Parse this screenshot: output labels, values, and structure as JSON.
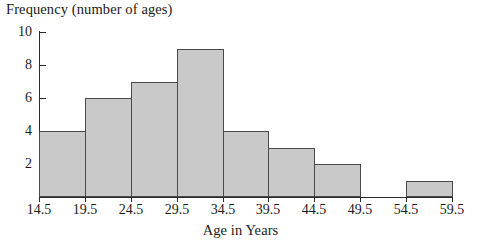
{
  "chart_data": {
    "type": "bar",
    "title": "Frequency (number of ages)",
    "xlabel": "Age in Years",
    "ylabel": "Frequency (number of ages)",
    "grid": false,
    "legend": "none",
    "bin_edges": [
      14.5,
      19.5,
      24.5,
      29.5,
      34.5,
      39.5,
      44.5,
      49.5,
      54.5,
      59.5
    ],
    "categories": [
      "14.5-19.5",
      "19.5-24.5",
      "24.5-29.5",
      "29.5-34.5",
      "34.5-39.5",
      "39.5-44.5",
      "44.5-49.5",
      "49.5-54.5",
      "54.5-59.5"
    ],
    "values": [
      4,
      6,
      7,
      9,
      4,
      3,
      2,
      0,
      1
    ],
    "xlim": [
      14.5,
      59.5
    ],
    "ylim": [
      0,
      10
    ],
    "ytick_labels": [
      "10",
      "8",
      "6",
      "4",
      "2"
    ],
    "ytick_values": [
      10,
      8,
      6,
      4,
      2
    ],
    "xtick_labels": [
      "14.5",
      "19.5",
      "24.5",
      "29.5",
      "34.5",
      "39.5",
      "44.5",
      "49.5",
      "54.5",
      "59.5"
    ],
    "bar_color": "#c9c9c9",
    "bar_edge_color": "#4a4a4a",
    "axis_color": "#2b2b2b"
  }
}
